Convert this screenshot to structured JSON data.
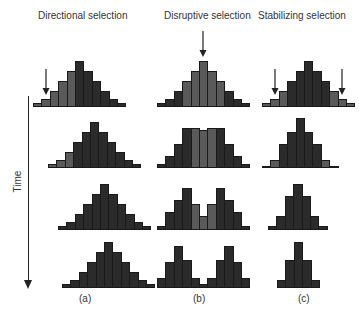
{
  "titles": {
    "a": "Directional selection",
    "b": "Disruptive selection",
    "c": "Stabilizing selection"
  },
  "panel_labels": {
    "a": "(a)",
    "b": "(b)",
    "c": "(c)"
  },
  "axis": {
    "label": "Time"
  },
  "colors": {
    "dark": "#2b2b2b",
    "selected": "#5a5a5a",
    "background": "#ffffff"
  },
  "diagram": {
    "rows": 4,
    "columns": [
      {
        "id": "a",
        "name": "Directional selection",
        "arrows_row1": [
          "left"
        ],
        "histograms": [
          {
            "left": 33,
            "baseline": 107,
            "heights": [
              4,
              8,
              16,
              26,
              36,
              46,
              36,
              26,
              16,
              8,
              4
            ],
            "selected": [
              0,
              1,
              2,
              3,
              4
            ]
          },
          {
            "left": 48,
            "baseline": 168,
            "heights": [
              4,
              8,
              16,
              26,
              36,
              46,
              36,
              26,
              16,
              8,
              4
            ],
            "selected": [
              0,
              1,
              2
            ]
          },
          {
            "left": 58,
            "baseline": 230,
            "heights": [
              4,
              8,
              16,
              26,
              36,
              46,
              36,
              26,
              16,
              8,
              4
            ],
            "selected": []
          },
          {
            "left": 62,
            "baseline": 288,
            "heights": [
              4,
              8,
              16,
              26,
              36,
              46,
              36,
              26,
              16,
              8,
              4
            ],
            "selected": []
          }
        ]
      },
      {
        "id": "b",
        "name": "Disruptive selection",
        "arrows_row1": [
          "center"
        ],
        "histograms": [
          {
            "left": 157,
            "baseline": 107,
            "heights": [
              4,
              8,
              16,
              26,
              36,
              46,
              36,
              26,
              16,
              8,
              4
            ],
            "selected": [
              3,
              4,
              5,
              6,
              7
            ]
          },
          {
            "left": 157,
            "baseline": 168,
            "heights": [
              4,
              12,
              24,
              40,
              40,
              38,
              40,
              40,
              24,
              12,
              4
            ],
            "selected": [
              4,
              5,
              6
            ]
          },
          {
            "left": 157,
            "baseline": 230,
            "heights": [
              4,
              18,
              30,
              42,
              26,
              14,
              26,
              42,
              30,
              18,
              4
            ],
            "selected": [
              4,
              5,
              6
            ]
          },
          {
            "left": 157,
            "baseline": 288,
            "heights": [
              10,
              26,
              42,
              28,
              10,
              4,
              10,
              28,
              42,
              26,
              10
            ],
            "selected": []
          }
        ]
      },
      {
        "id": "c",
        "name": "Stabilizing selection",
        "arrows_row1": [
          "left",
          "right"
        ],
        "histograms": [
          {
            "left": 262,
            "baseline": 107,
            "heights": [
              4,
              8,
              16,
              26,
              36,
              46,
              36,
              26,
              16,
              8,
              4
            ],
            "selected": [
              0,
              1,
              2,
              8,
              9,
              10
            ]
          },
          {
            "left": 262,
            "baseline": 168,
            "heights": [
              2,
              8,
              24,
              36,
              50,
              36,
              24,
              8,
              2
            ],
            "selected": [
              1,
              7
            ]
          },
          {
            "left": 268,
            "baseline": 230,
            "heights": [
              4,
              14,
              34,
              46,
              34,
              14,
              4
            ],
            "selected": []
          },
          {
            "left": 277,
            "baseline": 288,
            "heights": [
              8,
              28,
              46,
              28,
              8
            ],
            "selected": []
          }
        ]
      }
    ]
  }
}
